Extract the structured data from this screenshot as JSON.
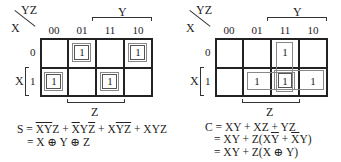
{
  "maps": [
    {
      "id": "sum",
      "corner_top": "YZ",
      "corner_left": "X",
      "columns": [
        "00",
        "01",
        "11",
        "10"
      ],
      "rows": [
        "0",
        "1"
      ],
      "cells": [
        [
          "",
          "1",
          "",
          "1"
        ],
        [
          "1",
          "",
          "1",
          ""
        ]
      ],
      "y_label": "Y",
      "x_label": "X",
      "z_label": "Z"
    },
    {
      "id": "carry",
      "corner_top": "YZ",
      "corner_left": "X",
      "columns": [
        "00",
        "01",
        "11",
        "10"
      ],
      "rows": [
        "0",
        "1"
      ],
      "cells": [
        [
          "",
          "",
          "1",
          ""
        ],
        [
          "",
          "1",
          "1",
          "1"
        ]
      ],
      "y_label": "Y",
      "x_label": "X",
      "z_label": "Z"
    }
  ],
  "equations": {
    "sum": {
      "line1_prefix": "S = ",
      "terms": [
        {
          "parts": [
            [
              "X",
              "bar"
            ],
            [
              "Y",
              "bar"
            ],
            [
              "Z",
              ""
            ]
          ]
        },
        {
          "parts": [
            [
              "X",
              "bar"
            ],
            [
              "Y",
              ""
            ],
            [
              "Z",
              "bar"
            ]
          ]
        },
        {
          "parts": [
            [
              "X",
              ""
            ],
            [
              "Y",
              "bar"
            ],
            [
              "Z",
              "bar"
            ]
          ]
        },
        {
          "parts": [
            [
              "X",
              ""
            ],
            [
              "Y",
              ""
            ],
            [
              "Z",
              ""
            ]
          ]
        }
      ],
      "line2": "= X ⊕ Y ⊕ Z"
    },
    "carry": {
      "line1": "C = XY + XZ + YZ",
      "line2_prefix": "= XY + Z(X",
      "line2_ybar": "Y",
      "line2_mid": " + ",
      "line2_xbar": "X",
      "line2_suffix": "Y)",
      "line3": "= XY + Z(X ⊕ Y)"
    }
  },
  "colors": {
    "grid": "#222222",
    "loop": "#888888",
    "text": "#222222"
  }
}
